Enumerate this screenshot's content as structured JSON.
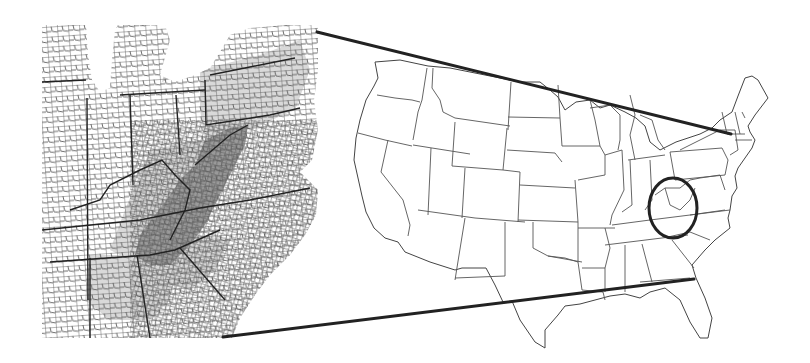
{
  "figure": {
    "description": "County-level inset map of the central Appalachian region linked by connector lines to a highlighted area on a map of the contiguous United States",
    "colors": {
      "background": "#ffffff",
      "border_lines": "#555555",
      "connector_lines": "#222222",
      "water": "#d0d0d0",
      "shade_light": "#d9d9d9",
      "shade_dark": "#9a9a9a",
      "highlight_ring": "#222222"
    }
  },
  "inset_map": {
    "region": "Central Appalachia county map",
    "shading_levels": [
      "none",
      "light",
      "dark"
    ],
    "bounds": {
      "x": 42,
      "y": 25,
      "width": 278,
      "height": 313
    }
  },
  "us_map": {
    "region": "Contiguous United States state boundaries",
    "highlight": {
      "cx": 673,
      "cy": 208,
      "rx": 24,
      "ry": 30
    }
  },
  "connectors": [
    {
      "x1": 317,
      "y1": 32,
      "x2": 731,
      "y2": 134
    },
    {
      "x1": 223,
      "y1": 337,
      "x2": 694,
      "y2": 279
    }
  ]
}
